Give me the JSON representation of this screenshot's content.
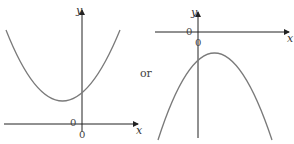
{
  "figure": {
    "left_graph": {
      "description": "upward-opening parabola, vertex left of y-axis above x-axis",
      "x_label": "x",
      "y_label": "y",
      "origin_label_left": "0",
      "origin_label_below": "0"
    },
    "connector": "or",
    "right_graph": {
      "description": "downward-opening parabola, vertex right of y-axis below x-axis",
      "x_label": "x",
      "y_label": "y",
      "origin_label_left": "0",
      "origin_label_below": "0"
    },
    "colors": {
      "axis": "#222222",
      "curve": "#7a7a7a"
    }
  }
}
